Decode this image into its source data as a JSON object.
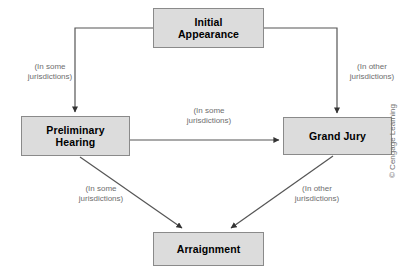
{
  "diagram": {
    "nodes": [
      {
        "id": "initial-appearance",
        "label": "Initial\nAppearance"
      },
      {
        "id": "preliminary-hearing",
        "label": "Preliminary\nHearing"
      },
      {
        "id": "grand-jury",
        "label": "Grand Jury"
      },
      {
        "id": "arraignment",
        "label": "Arraignment"
      }
    ],
    "edges": [
      {
        "id": "ia-to-ph",
        "from": "initial-appearance",
        "to": "preliminary-hearing",
        "label": "(In some\njurisdictions)"
      },
      {
        "id": "ia-to-gj",
        "from": "initial-appearance",
        "to": "grand-jury",
        "label": "(In other\njurisdictions)"
      },
      {
        "id": "ph-to-gj",
        "from": "preliminary-hearing",
        "to": "grand-jury",
        "label": "(In some\njurisdictions)"
      },
      {
        "id": "ph-to-arr",
        "from": "preliminary-hearing",
        "to": "arraignment",
        "label": "(In some\njurisdictions)"
      },
      {
        "id": "gj-to-arr",
        "from": "grand-jury",
        "to": "arraignment",
        "label": "(In other\njurisdictions)"
      }
    ],
    "colors": {
      "node_fill": "#dcdcdc",
      "node_border": "#8a8a8a",
      "node_text": "#000000",
      "edge_line": "#555555",
      "edge_label_text": "#6e6e6e",
      "background": "#ffffff"
    },
    "credit": "© Cengage Learning"
  }
}
